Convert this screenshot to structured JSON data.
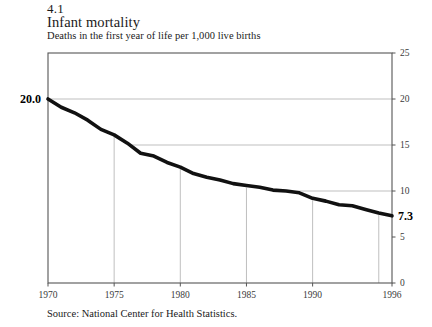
{
  "figure": {
    "number": "4.1",
    "title": "Infant mortality",
    "subtitle": "Deaths in the first year of life per 1,000 live births",
    "source": "Source: National Center for Health Statistics."
  },
  "annotations": {
    "start_value_label": "20.0",
    "end_value_label": "7.3"
  },
  "colors": {
    "line": "#111111",
    "grid": "#b8b8b8",
    "frame": "#555555",
    "text": "#1a1a1a"
  },
  "chart_data": {
    "type": "line",
    "title": "Infant mortality",
    "subtitle": "Deaths in the first year of life per 1,000 live births",
    "xlabel": "",
    "ylabel": "",
    "xlim": [
      1970,
      1996
    ],
    "ylim": [
      0,
      25
    ],
    "grid": true,
    "legend": false,
    "y_axis_position": "right",
    "xticks": [
      1970,
      1975,
      1980,
      1985,
      1990,
      1996
    ],
    "xtick_labels": [
      "1970",
      "1975",
      "1980",
      "1985",
      "1990",
      "1996"
    ],
    "yticks": [
      0,
      5,
      10,
      15,
      20,
      25
    ],
    "ytick_labels": [
      "0",
      "5",
      "10",
      "15",
      "20",
      "25"
    ],
    "gridlines_vertical_at": [
      1975,
      1980,
      1985,
      1990,
      1995
    ],
    "gridlines_horizontal_at": [
      10,
      15,
      20
    ],
    "x": [
      1970,
      1971,
      1972,
      1973,
      1974,
      1975,
      1976,
      1977,
      1978,
      1979,
      1980,
      1981,
      1982,
      1983,
      1984,
      1985,
      1986,
      1987,
      1988,
      1989,
      1990,
      1991,
      1992,
      1993,
      1994,
      1995,
      1996
    ],
    "values": [
      20.0,
      19.1,
      18.5,
      17.7,
      16.7,
      16.1,
      15.2,
      14.1,
      13.8,
      13.1,
      12.6,
      11.9,
      11.5,
      11.2,
      10.8,
      10.6,
      10.4,
      10.1,
      10.0,
      9.8,
      9.2,
      8.9,
      8.5,
      8.4,
      8.0,
      7.6,
      7.3
    ],
    "series": [
      {
        "name": "Infant mortality rate",
        "values": [
          20.0,
          19.1,
          18.5,
          17.7,
          16.7,
          16.1,
          15.2,
          14.1,
          13.8,
          13.1,
          12.6,
          11.9,
          11.5,
          11.2,
          10.8,
          10.6,
          10.4,
          10.1,
          10.0,
          9.8,
          9.2,
          8.9,
          8.5,
          8.4,
          8.0,
          7.6,
          7.3
        ]
      }
    ],
    "annotations": [
      {
        "text": "20.0",
        "x": 1970,
        "y": 20.0,
        "position": "left"
      },
      {
        "text": "7.3",
        "x": 1996,
        "y": 7.3,
        "position": "right"
      }
    ]
  }
}
